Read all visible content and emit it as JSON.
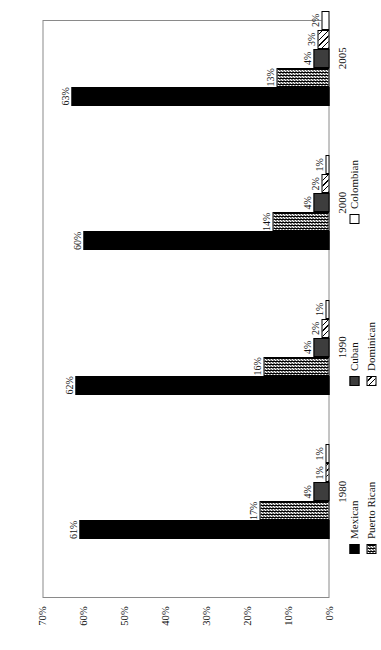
{
  "chart_data": {
    "type": "bar",
    "title": "",
    "subtitle": "",
    "xlabel": "",
    "ylabel": "",
    "orientation": "vertical-rotated-90ccw",
    "grid": false,
    "legend_position": "bottom",
    "categories": [
      "1980",
      "1990",
      "2000",
      "2005"
    ],
    "ylim": [
      0,
      70
    ],
    "ytick_labels": [
      "70%",
      "60%",
      "50%",
      "40%",
      "30%",
      "20%",
      "10%",
      "0%"
    ],
    "ytick_values": [
      70,
      60,
      50,
      40,
      30,
      20,
      10,
      0
    ],
    "value_suffix": "%",
    "series": [
      {
        "name": "Mexican",
        "color": "#000000",
        "pattern": "solid-black",
        "values": [
          61,
          62,
          60,
          63
        ],
        "labels": [
          "61%",
          "62%",
          "60%",
          "63%"
        ]
      },
      {
        "name": "Puerto Rican",
        "color": "#000000",
        "pattern": "checkerboard",
        "values": [
          17,
          16,
          14,
          13
        ],
        "labels": [
          "17%",
          "16%",
          "14%",
          "13%"
        ]
      },
      {
        "name": "Cuban",
        "color": "#3d3d3d",
        "pattern": "solid-dark-gray",
        "values": [
          4,
          4,
          4,
          4
        ],
        "labels": [
          "4%",
          "4%",
          "4%",
          "4%"
        ]
      },
      {
        "name": "Dominican",
        "color": "#000000",
        "pattern": "diagonal-hatch",
        "values": [
          1,
          2,
          2,
          3
        ],
        "labels": [
          "1%",
          "2%",
          "2%",
          "3%"
        ]
      },
      {
        "name": "Colombian",
        "color": "#ffffff",
        "pattern": "solid-white",
        "values": [
          1,
          1,
          1,
          2
        ],
        "labels": [
          "1%",
          "1%",
          "1%",
          "2%"
        ]
      }
    ]
  },
  "legend": {
    "rows": [
      [
        "Mexican",
        "Cuban",
        "Colombian"
      ],
      [
        "Puerto Rican",
        "Dominican"
      ]
    ]
  }
}
